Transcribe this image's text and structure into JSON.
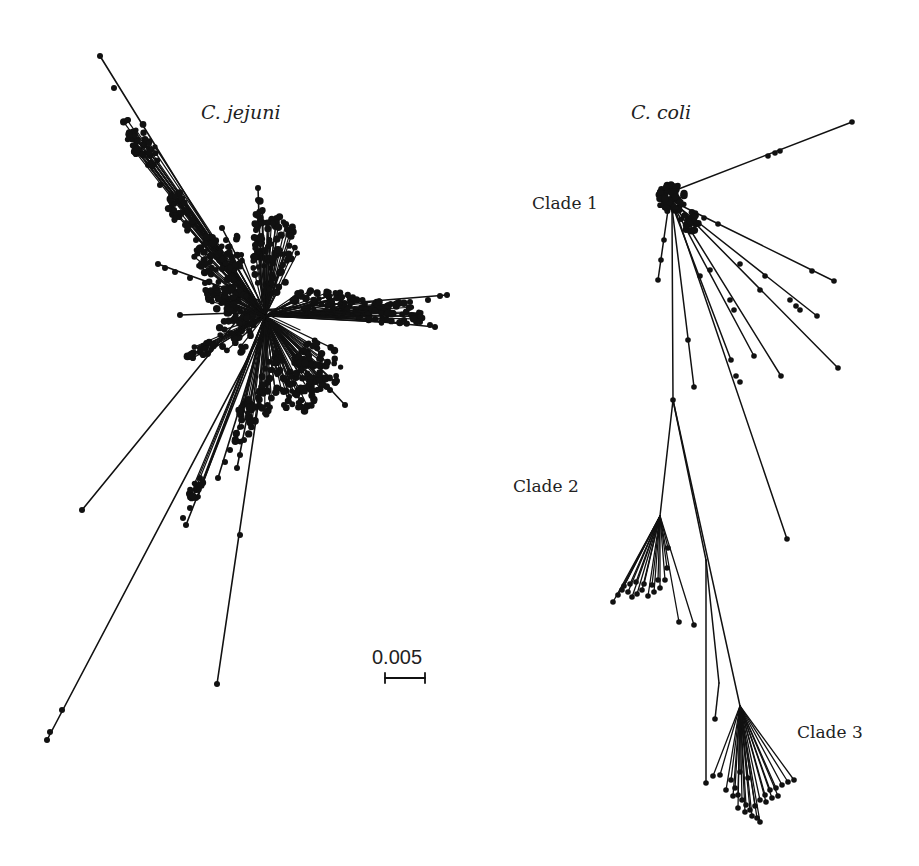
{
  "figure": {
    "background": "#ffffff",
    "ink_color": "#111111",
    "species_labels": [
      {
        "id": "jejuni",
        "text": "C. jejuni",
        "x": 201,
        "y": 101
      },
      {
        "id": "coli",
        "text": "C. coli",
        "x": 631,
        "y": 101
      }
    ],
    "clade_labels": [
      {
        "id": "clade1",
        "text": "Clade 1",
        "x": 532,
        "y": 193
      },
      {
        "id": "clade2",
        "text": "Clade 2",
        "x": 513,
        "y": 476
      },
      {
        "id": "clade3",
        "text": "Clade 3",
        "x": 797,
        "y": 722
      }
    ],
    "scale_bar": {
      "label": "0.005",
      "value": 0.005,
      "x1": 385,
      "x2": 425,
      "y": 678,
      "label_x": 372,
      "label_y": 646
    }
  },
  "trees": [
    {
      "name": "C. jejuni",
      "root": [
        265,
        316
      ],
      "branches": [
        {
          "from": [
            252,
            302
          ],
          "to": [
            100,
            56
          ],
          "nodes": [
            [
              114,
              88
            ],
            [
              128,
              120
            ],
            [
              135,
              140
            ],
            [
              140,
              150
            ],
            [
              148,
              165
            ],
            [
              160,
              185
            ],
            [
              172,
              205
            ],
            [
              185,
              225
            ],
            [
              196,
              240
            ],
            [
              210,
              262
            ]
          ]
        },
        {
          "from": [
            252,
            302
          ],
          "to": [
            82,
            510
          ],
          "nodes": []
        },
        {
          "from": [
            268,
            320
          ],
          "to": [
            47,
            740
          ],
          "nodes": [
            [
              50,
              732
            ],
            [
              62,
              710
            ],
            [
              190,
              495
            ],
            [
              196,
              485
            ],
            [
              200,
              478
            ]
          ]
        },
        {
          "from": [
            270,
            325
          ],
          "to": [
            217,
            684
          ],
          "nodes": [
            [
              240,
              535
            ]
          ]
        },
        {
          "from": [
            266,
            322
          ],
          "to": [
            186,
            525
          ],
          "nodes": [
            [
              183,
              518
            ],
            [
              190,
              508
            ],
            [
              196,
              498
            ]
          ]
        },
        {
          "from": [
            266,
            322
          ],
          "to": [
            218,
            478
          ],
          "nodes": [
            [
              225,
              462
            ],
            [
              230,
              450
            ]
          ]
        },
        {
          "from": [
            266,
            322
          ],
          "to": [
            237,
            468
          ],
          "nodes": [
            [
              240,
              455
            ],
            [
              244,
              440
            ]
          ]
        },
        {
          "from": [
            262,
            310
          ],
          "to": [
            447,
            295
          ],
          "nodes": [
            [
              440,
              296
            ],
            [
              428,
              300
            ],
            [
              410,
              302
            ]
          ]
        },
        {
          "from": [
            262,
            310
          ],
          "to": [
            435,
            327
          ],
          "nodes": [
            [
              430,
              325
            ],
            [
              420,
              322
            ]
          ]
        },
        {
          "from": [
            262,
            312
          ],
          "to": [
            180,
            315
          ],
          "nodes": []
        },
        {
          "from": [
            258,
            300
          ],
          "to": [
            158,
            264
          ],
          "nodes": [
            [
              165,
              268
            ],
            [
              175,
              272
            ],
            [
              190,
              278
            ],
            [
              205,
              283
            ]
          ]
        },
        {
          "from": [
            262,
            302
          ],
          "to": [
            258,
            188
          ],
          "nodes": [
            [
              258,
              200
            ],
            [
              258,
              215
            ],
            [
              256,
              230
            ],
            [
              255,
              245
            ],
            [
              254,
              260
            ]
          ]
        },
        {
          "from": [
            262,
            305
          ],
          "to": [
            222,
            228
          ],
          "nodes": [
            [
              226,
              240
            ],
            [
              230,
              255
            ]
          ]
        },
        {
          "from": [
            268,
            322
          ],
          "to": [
            345,
            405
          ],
          "nodes": [
            [
              330,
              390
            ],
            [
              320,
              380
            ]
          ]
        }
      ],
      "clusters": [
        {
          "cx": 140,
          "cy": 140,
          "rx": 12,
          "ry": 30,
          "rot": -28,
          "count": 40
        },
        {
          "cx": 180,
          "cy": 210,
          "rx": 10,
          "ry": 24,
          "rot": -28,
          "count": 30
        },
        {
          "cx": 210,
          "cy": 255,
          "rx": 16,
          "ry": 22,
          "rot": -20,
          "count": 40
        },
        {
          "cx": 232,
          "cy": 260,
          "rx": 10,
          "ry": 28,
          "rot": 0,
          "count": 30
        },
        {
          "cx": 275,
          "cy": 255,
          "rx": 22,
          "ry": 40,
          "rot": 10,
          "count": 80
        },
        {
          "cx": 258,
          "cy": 225,
          "rx": 6,
          "ry": 30,
          "rot": 0,
          "count": 20
        },
        {
          "cx": 235,
          "cy": 320,
          "rx": 20,
          "ry": 35,
          "rot": 0,
          "count": 70
        },
        {
          "cx": 220,
          "cy": 295,
          "rx": 20,
          "ry": 14,
          "rot": 20,
          "count": 40
        },
        {
          "cx": 325,
          "cy": 302,
          "rx": 35,
          "ry": 12,
          "rot": 3,
          "count": 60
        },
        {
          "cx": 385,
          "cy": 312,
          "rx": 40,
          "ry": 12,
          "rot": 6,
          "count": 80
        },
        {
          "cx": 320,
          "cy": 365,
          "rx": 22,
          "ry": 26,
          "rot": 0,
          "count": 60
        },
        {
          "cx": 300,
          "cy": 385,
          "rx": 20,
          "ry": 30,
          "rot": 10,
          "count": 60
        },
        {
          "cx": 270,
          "cy": 385,
          "rx": 10,
          "ry": 35,
          "rot": 15,
          "count": 40
        },
        {
          "cx": 245,
          "cy": 420,
          "rx": 10,
          "ry": 25,
          "rot": 20,
          "count": 30
        },
        {
          "cx": 200,
          "cy": 350,
          "rx": 16,
          "ry": 8,
          "rot": -30,
          "count": 20
        },
        {
          "cx": 195,
          "cy": 490,
          "rx": 6,
          "ry": 16,
          "rot": 25,
          "count": 14
        }
      ]
    },
    {
      "name": "C. coli",
      "root": [
        672,
        198
      ],
      "branches": [
        {
          "from": [
            676,
            190
          ],
          "to": [
            852,
            122
          ],
          "nodes": [
            [
              768,
              156
            ],
            [
              775,
              153
            ],
            [
              780,
              151
            ]
          ]
        },
        {
          "from": [
            680,
            205
          ],
          "to": [
            834,
            281
          ],
          "nodes": [
            [
              704,
              218
            ],
            [
              718,
              224
            ],
            [
              812,
              271
            ]
          ]
        },
        {
          "from": [
            680,
            208
          ],
          "to": [
            817,
            316
          ],
          "nodes": [
            [
              765,
              276
            ],
            [
              790,
              300
            ],
            [
              796,
              306
            ],
            [
              800,
              310
            ]
          ]
        },
        {
          "from": [
            680,
            208
          ],
          "to": [
            838,
            368
          ],
          "nodes": [
            [
              740,
              264
            ],
            [
              760,
              290
            ]
          ]
        },
        {
          "from": [
            676,
            210
          ],
          "to": [
            754,
            356
          ],
          "nodes": [
            [
              730,
              300
            ]
          ]
        },
        {
          "from": [
            678,
            210
          ],
          "to": [
            781,
            376
          ],
          "nodes": [
            [
              710,
              270
            ],
            [
              734,
              310
            ]
          ]
        },
        {
          "from": [
            674,
            210
          ],
          "to": [
            731,
            360
          ],
          "nodes": [
            [
              700,
              276
            ]
          ]
        },
        {
          "from": [
            672,
            208
          ],
          "to": [
            694,
            387
          ],
          "nodes": [
            [
              688,
              340
            ]
          ]
        },
        {
          "from": [
            668,
            210
          ],
          "to": [
            658,
            280
          ],
          "nodes": [
            [
              661,
              260
            ],
            [
              664,
              240
            ]
          ]
        },
        {
          "from": [
            676,
            212
          ],
          "to": [
            787,
            539
          ],
          "nodes": [
            [
              740,
              382
            ],
            [
              736,
              376
            ]
          ]
        },
        {
          "from": [
            672,
            210
          ],
          "to": [
            673,
            400
          ],
          "nodes": []
        }
      ],
      "clade2": {
        "stem_from": [
          673,
          400
        ],
        "stem_to": [
          660,
          516
        ],
        "tips": [
          [
            679,
            622
          ],
          [
            694,
            625
          ],
          [
            613,
            602
          ],
          [
            618,
            595
          ],
          [
            622,
            590
          ],
          [
            628,
            592
          ],
          [
            632,
            597
          ],
          [
            637,
            594
          ],
          [
            642,
            590
          ],
          [
            648,
            596
          ],
          [
            654,
            592
          ],
          [
            660,
            588
          ],
          [
            665,
            580
          ],
          [
            667,
            568
          ],
          [
            668,
            548
          ],
          [
            624,
            586
          ],
          [
            630,
            584
          ],
          [
            636,
            582
          ],
          [
            644,
            584
          ],
          [
            652,
            585
          ],
          [
            658,
            580
          ]
        ]
      },
      "clade3": {
        "stem_from": [
          673,
          400
        ],
        "stem_to": [
          740,
          706
        ],
        "side_tips": [
          [
            706,
            783
          ],
          [
            715,
            719
          ]
        ],
        "side_from": [
          [
            706,
            560
          ],
          [
            719,
            683
          ]
        ],
        "tips": [
          [
            713,
            776
          ],
          [
            720,
            775
          ],
          [
            731,
            780
          ],
          [
            735,
            788
          ],
          [
            738,
            795
          ],
          [
            742,
            800
          ],
          [
            746,
            805
          ],
          [
            750,
            810
          ],
          [
            755,
            806
          ],
          [
            760,
            800
          ],
          [
            765,
            795
          ],
          [
            770,
            790
          ],
          [
            776,
            788
          ],
          [
            782,
            785
          ],
          [
            788,
            782
          ],
          [
            794,
            780
          ],
          [
            745,
            812
          ],
          [
            752,
            816
          ],
          [
            757,
            818
          ],
          [
            760,
            822
          ],
          [
            738,
            808
          ],
          [
            726,
            790
          ],
          [
            733,
            796
          ],
          [
            766,
            802
          ],
          [
            772,
            798
          ],
          [
            778,
            796
          ],
          [
            740,
            772
          ],
          [
            748,
            778
          ]
        ]
      }
    }
  ]
}
